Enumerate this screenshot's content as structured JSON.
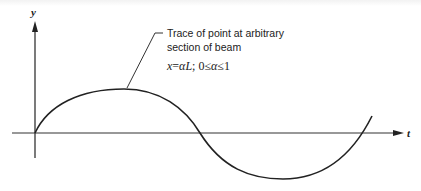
{
  "diagram": {
    "axes": {
      "y_label": "y",
      "t_label": "t"
    },
    "annotation": {
      "line1": "Trace of point at arbitrary",
      "line2": "section of beam",
      "formula_var": "x",
      "formula_eq": "=",
      "formula_alpha_L": "αL",
      "formula_sep": "; 0≤",
      "formula_alpha2": "α",
      "formula_end": "≤1"
    },
    "curve": {
      "description": "One full period of a sinusoid-like trace starting at origin, positive lobe then negative lobe, continuing upward past t-axis",
      "color": "#222222"
    }
  }
}
